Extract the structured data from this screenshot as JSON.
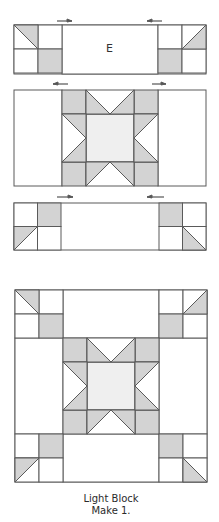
{
  "colors": {
    "stroke": "#5a5a5a",
    "gray": "#d3d3d3",
    "light": "#efefef",
    "white": "#ffffff",
    "arrow": "#555555",
    "text": "#2a2a2a"
  },
  "units": {
    "top_row": {
      "label": "E",
      "frame": {
        "x": 14,
        "y": 25,
        "w": 192,
        "h": 49
      },
      "arrows": [
        {
          "x1": 57,
          "x2": 72,
          "y": 21,
          "dir": "right"
        },
        {
          "x1": 147,
          "x2": 162,
          "y": 21,
          "dir": "left"
        }
      ]
    },
    "middle_row": {
      "frame": {
        "x": 14,
        "y": 90,
        "w": 192,
        "h": 96
      },
      "arrows": [
        {
          "x1": 53,
          "x2": 68,
          "y": 84,
          "dir": "left"
        },
        {
          "x1": 152,
          "x2": 166,
          "y": 84,
          "dir": "right"
        }
      ]
    },
    "bottom_row": {
      "frame": {
        "x": 14,
        "y": 203,
        "w": 192,
        "h": 47
      },
      "arrows": [
        {
          "x1": 57,
          "x2": 73,
          "y": 197,
          "dir": "right"
        },
        {
          "x1": 147,
          "x2": 164,
          "y": 197,
          "dir": "left"
        }
      ]
    },
    "composite": {
      "frame": {
        "x": 15,
        "y": 290,
        "w": 192,
        "h": 192
      }
    }
  },
  "caption": {
    "line1": "Light Block",
    "line2": "Make 1."
  }
}
